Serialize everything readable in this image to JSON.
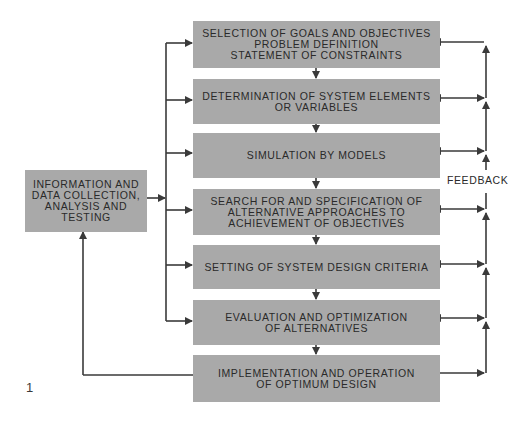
{
  "figure": {
    "number": "1",
    "source_box": {
      "label": "INFORMATION AND\nDATA COLLECTION,\nANALYSIS AND\nTESTING"
    },
    "steps": [
      {
        "label": "SELECTION OF GOALS AND OBJECTIVES\nPROBLEM DEFINITION\nSTATEMENT OF CONSTRAINTS"
      },
      {
        "label": "DETERMINATION OF SYSTEM ELEMENTS\nOR VARIABLES"
      },
      {
        "label": "SIMULATION BY MODELS"
      },
      {
        "label": "SEARCH FOR AND SPECIFICATION OF\nALTERNATIVE APPROACHES TO\nACHIEVEMENT OF OBJECTIVES"
      },
      {
        "label": "SETTING OF SYSTEM DESIGN CRITERIA"
      },
      {
        "label": "EVALUATION AND OPTIMIZATION\nOF ALTERNATIVES"
      },
      {
        "label": "IMPLEMENTATION AND OPERATION\nOF OPTIMUM DESIGN"
      }
    ],
    "feedback_label": "FEEDBACK",
    "colors": {
      "box_fill": "#a9a9a9",
      "line": "#3a3a3a",
      "text": "#2a2a2a"
    }
  }
}
